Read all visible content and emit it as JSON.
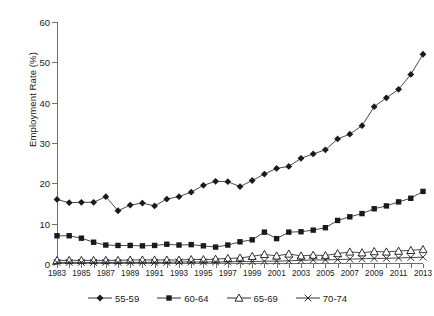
{
  "chart_data": {
    "type": "line",
    "title": "",
    "xlabel": "",
    "ylabel": "Employment Rate (%)",
    "ylim": [
      0,
      60
    ],
    "yticks": [
      0,
      10,
      20,
      30,
      40,
      50,
      60
    ],
    "xlim": [
      1983,
      2013
    ],
    "grid": false,
    "legend_position": "bottom",
    "x": [
      1983,
      1984,
      1985,
      1986,
      1987,
      1988,
      1989,
      1990,
      1991,
      1992,
      1993,
      1994,
      1995,
      1996,
      1997,
      1998,
      1999,
      2000,
      2001,
      2002,
      2003,
      2004,
      2005,
      2006,
      2007,
      2008,
      2009,
      2010,
      2011,
      2012,
      2013
    ],
    "xtick_labels": [
      "1983",
      "1985",
      "1987",
      "1989",
      "1991",
      "1993",
      "1995",
      "1997",
      "1999",
      "2001",
      "2003",
      "2005",
      "2007",
      "2009",
      "2011",
      "2013"
    ],
    "series": [
      {
        "name": "55-59",
        "marker": "filled-diamond",
        "values": [
          16.0,
          15.2,
          15.3,
          15.3,
          16.7,
          13.2,
          14.6,
          15.1,
          14.4,
          16.1,
          16.7,
          17.8,
          19.5,
          20.5,
          20.4,
          19.2,
          20.7,
          22.3,
          23.7,
          24.2,
          26.2,
          27.3,
          28.3,
          31.0,
          32.2,
          34.3,
          39.0,
          41.2,
          43.3,
          47.0,
          52.0
        ]
      },
      {
        "name": "60-64",
        "marker": "filled-square",
        "values": [
          7.0,
          7.0,
          6.4,
          5.4,
          4.7,
          4.6,
          4.6,
          4.5,
          4.6,
          4.9,
          4.7,
          4.8,
          4.5,
          4.2,
          4.7,
          5.5,
          6.0,
          7.9,
          6.3,
          7.9,
          8.0,
          8.4,
          9.0,
          10.8,
          11.7,
          12.5,
          13.7,
          14.4,
          15.4,
          16.3,
          18.0
        ]
      },
      {
        "name": "65-69",
        "marker": "open-triangle",
        "values": [
          0.9,
          0.9,
          0.9,
          0.9,
          0.9,
          0.9,
          1.0,
          1.0,
          1.0,
          1.0,
          1.0,
          1.1,
          1.1,
          1.2,
          1.4,
          1.5,
          1.9,
          2.4,
          2.0,
          2.5,
          2.0,
          2.2,
          2.1,
          2.6,
          3.0,
          2.8,
          3.1,
          3.0,
          3.2,
          3.4,
          3.6
        ]
      },
      {
        "name": "70-74",
        "marker": "cross-x",
        "values": [
          0.4,
          0.4,
          0.4,
          0.4,
          0.4,
          0.4,
          0.4,
          0.4,
          0.4,
          0.4,
          0.5,
          0.5,
          0.5,
          0.5,
          0.5,
          0.6,
          0.6,
          0.7,
          0.7,
          0.8,
          0.9,
          1.0,
          1.0,
          1.1,
          1.2,
          1.3,
          1.4,
          1.4,
          1.5,
          1.6,
          1.7
        ]
      }
    ],
    "colors": {
      "line": "#1a1a1a",
      "axis": "#6f6f6f",
      "background": "#ffffff"
    }
  }
}
